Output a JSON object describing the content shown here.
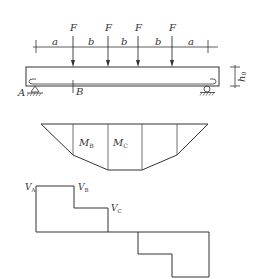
{
  "beam": {
    "force_label": "F",
    "force_count": 4,
    "spans": [
      "a",
      "b",
      "b",
      "b",
      "a"
    ],
    "support_left_label": "A",
    "section_label": "B",
    "height_label": "h",
    "height_sub": "0"
  },
  "moment_diagram": {
    "labels": [
      {
        "main": "M",
        "sub": "B"
      },
      {
        "main": "M",
        "sub": "C"
      }
    ]
  },
  "shear_diagram": {
    "labels": [
      {
        "main": "V",
        "sub": "A"
      },
      {
        "main": "V",
        "sub": "B"
      },
      {
        "main": "V",
        "sub": "C"
      }
    ]
  }
}
